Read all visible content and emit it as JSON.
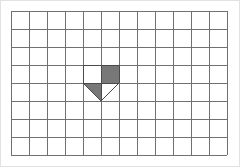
{
  "figure": {
    "background_color": "#ffffff",
    "outer_border_color": "#e2e2e2",
    "canvas": {
      "width": 240,
      "height": 167
    }
  },
  "grid": {
    "name": "square-grid",
    "columns": 12,
    "rows": 8,
    "cell_width": 18,
    "cell_height": 18,
    "origin_x": 11,
    "origin_y": 11,
    "right_x": 227,
    "bottom_y": 155,
    "line_color": "#707070",
    "line_width": 1,
    "fill_color": "#ffffff"
  },
  "shape": {
    "name": "shaded-pentagon",
    "description": "Pentagon (home-plate pointing down) spanning 2 cells wide and 2 cells tall; upper-right cell and lower-left triangle are shaded dark gray.",
    "fill_color": "#787878",
    "outline_color": "#4a4a4a",
    "outline_width": 1,
    "grid_cells": {
      "col_start": 4,
      "col_end": 6,
      "row_start": 3,
      "row_end": 5
    },
    "bounds_px": {
      "left": 83,
      "top": 65,
      "right": 119,
      "bottom": 101
    },
    "midline_x": 101,
    "midline_y": 83,
    "apex_px": {
      "x": 101,
      "y": 101
    },
    "outline_points": "83,65 119,65 119,83 101,101 83,83",
    "quadrants": [
      {
        "name": "top-left-square",
        "filled": false,
        "points": "83,65 101,65 101,83 83,83"
      },
      {
        "name": "top-right-square",
        "filled": true,
        "points": "101,65 119,65 119,83 101,83"
      },
      {
        "name": "bottom-left-triangle",
        "filled": true,
        "points": "83,83 101,83 101,101"
      },
      {
        "name": "bottom-right-triangle",
        "filled": false,
        "points": "101,83 119,83 101,101"
      }
    ]
  }
}
